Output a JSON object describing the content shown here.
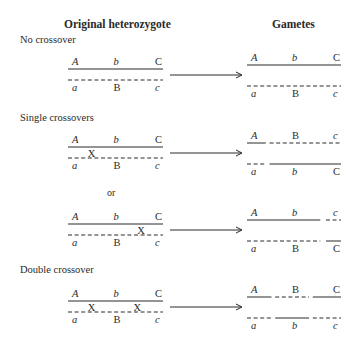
{
  "headers": {
    "left": "Original heterozygote",
    "right": "Gametes"
  },
  "sections": [
    {
      "title": "No crossover",
      "title_y": 40,
      "y": 70,
      "parent": {
        "crossovers": []
      },
      "gametes": [
        {
          "segments": [
            [
              "solid",
              0,
              1
            ]
          ],
          "labels": [
            "A",
            "b",
            "C"
          ]
        },
        {
          "segments": [
            [
              "dash",
              0,
              1
            ]
          ],
          "labels": [
            "a",
            "B",
            "c"
          ]
        }
      ]
    },
    {
      "title": "Single crossovers",
      "title_y": 118,
      "y": 148,
      "parent": {
        "crossovers": [
          0.24
        ]
      },
      "gametes": [
        {
          "segments": [
            [
              "solid",
              0,
              0.2
            ],
            [
              "dash",
              0.24,
              1
            ]
          ],
          "labels": [
            "A",
            "B",
            "c"
          ]
        },
        {
          "segments": [
            [
              "dash",
              0,
              0.2
            ],
            [
              "solid",
              0.24,
              1
            ]
          ],
          "labels": [
            "a",
            "b",
            "C"
          ]
        }
      ]
    },
    {
      "or_label": "or",
      "or_y": 193,
      "y": 225,
      "parent": {
        "crossovers": [
          0.76
        ]
      },
      "gametes": [
        {
          "segments": [
            [
              "solid",
              0,
              0.78
            ],
            [
              "dash",
              0.84,
              1
            ]
          ],
          "labels": [
            "A",
            "b",
            "c"
          ]
        },
        {
          "segments": [
            [
              "dash",
              0,
              0.78
            ],
            [
              "solid",
              0.84,
              1
            ]
          ],
          "labels": [
            "a",
            "B",
            "C"
          ]
        }
      ]
    },
    {
      "title": "Double crossover",
      "title_y": 270,
      "y": 302,
      "parent": {
        "crossovers": [
          0.24,
          0.72
        ]
      },
      "gametes": [
        {
          "segments": [
            [
              "solid",
              0,
              0.26
            ],
            [
              "dash",
              0.3,
              0.66
            ],
            [
              "solid",
              0.7,
              1
            ]
          ],
          "labels": [
            "A",
            "B",
            "C"
          ]
        },
        {
          "segments": [
            [
              "dash",
              0,
              0.26
            ],
            [
              "solid",
              0.3,
              0.66
            ],
            [
              "dash",
              0.7,
              1
            ]
          ],
          "labels": [
            "a",
            "b",
            "c"
          ]
        }
      ]
    }
  ],
  "parent_labels": {
    "top": [
      "A",
      "b",
      "C"
    ],
    "bottom": [
      "a",
      "B",
      "c"
    ]
  },
  "crossover_mark": "X",
  "colors": {
    "ink": "#2a2a2a",
    "background": "#ffffff"
  }
}
